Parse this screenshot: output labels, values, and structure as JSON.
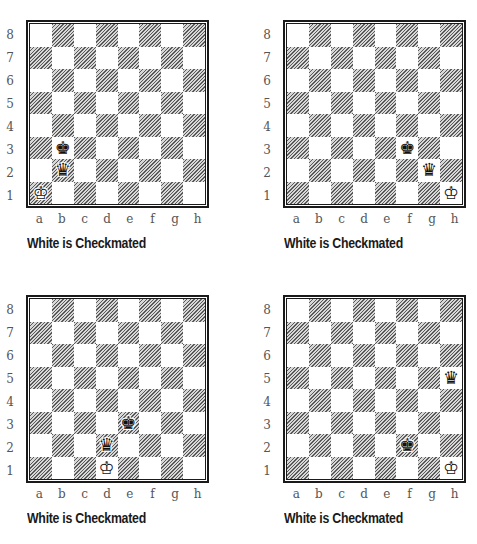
{
  "files": [
    "a",
    "b",
    "c",
    "d",
    "e",
    "f",
    "g",
    "h"
  ],
  "ranks": [
    "8",
    "7",
    "6",
    "5",
    "4",
    "3",
    "2",
    "1"
  ],
  "diagrams": [
    {
      "caption": "White is Checkmated",
      "pieces": [
        {
          "square": "a1",
          "piece": "king",
          "color": "white",
          "glyph": "♔"
        },
        {
          "square": "b3",
          "piece": "king",
          "color": "black",
          "glyph": "♚"
        },
        {
          "square": "b2",
          "piece": "queen",
          "color": "black",
          "glyph": "♛"
        }
      ]
    },
    {
      "caption": "White is Checkmated",
      "pieces": [
        {
          "square": "h1",
          "piece": "king",
          "color": "white",
          "glyph": "♔"
        },
        {
          "square": "f3",
          "piece": "king",
          "color": "black",
          "glyph": "♚"
        },
        {
          "square": "g2",
          "piece": "queen",
          "color": "black",
          "glyph": "♛"
        }
      ]
    },
    {
      "caption": "White is Checkmated",
      "pieces": [
        {
          "square": "d1",
          "piece": "king",
          "color": "white",
          "glyph": "♔"
        },
        {
          "square": "e3",
          "piece": "king",
          "color": "black",
          "glyph": "♚"
        },
        {
          "square": "d2",
          "piece": "queen",
          "color": "black",
          "glyph": "♛"
        }
      ]
    },
    {
      "caption": "White is Checkmated",
      "pieces": [
        {
          "square": "h1",
          "piece": "king",
          "color": "white",
          "glyph": "♔"
        },
        {
          "square": "f2",
          "piece": "king",
          "color": "black",
          "glyph": "♚"
        },
        {
          "square": "h5",
          "piece": "queen",
          "color": "black",
          "glyph": "♛"
        }
      ]
    }
  ]
}
